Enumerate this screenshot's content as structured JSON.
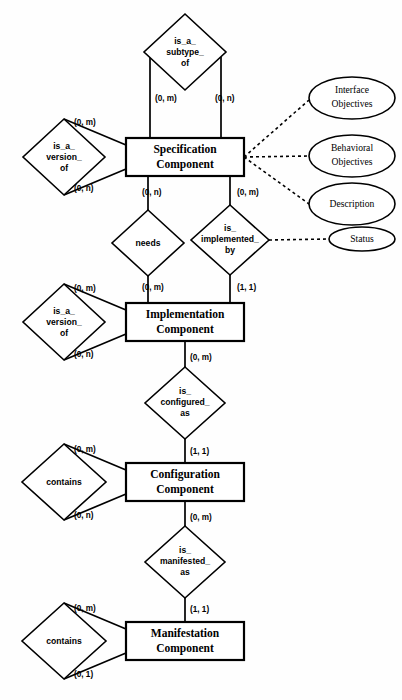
{
  "diagram": {
    "background_color": "#fefefe",
    "line_color": "#000000",
    "entities": [
      {
        "id": "specification-component",
        "label_line1": "Specification",
        "label_line2": "Component",
        "x": 126,
        "y": 138,
        "w": 118,
        "h": 38
      },
      {
        "id": "implementation-component",
        "label_line1": "Implementation",
        "label_line2": "Component",
        "x": 126,
        "y": 303,
        "w": 118,
        "h": 38
      },
      {
        "id": "configuration-component",
        "label_line1": "Configuration",
        "label_line2": "Component",
        "x": 126,
        "y": 463,
        "w": 118,
        "h": 38
      },
      {
        "id": "manifestation-component",
        "label_line1": "Manifestation",
        "label_line2": "Component",
        "x": 126,
        "y": 622,
        "w": 118,
        "h": 38
      }
    ],
    "relationships": [
      {
        "id": "is-a-subtype-of",
        "lines": [
          "is_a_",
          "subtype_",
          "of"
        ],
        "cx": 185,
        "cy": 52,
        "rx": 41,
        "ry": 38
      },
      {
        "id": "is-a-version-of-spec",
        "lines": [
          "is_a_",
          "version_",
          "of"
        ],
        "cx": 64,
        "cy": 157,
        "rx": 41,
        "ry": 38
      },
      {
        "id": "needs",
        "lines": [
          "needs"
        ],
        "cx": 148,
        "cy": 243,
        "rx": 36,
        "ry": 33
      },
      {
        "id": "is-implemented-by",
        "lines": [
          "is_",
          "implemented_",
          "by"
        ],
        "cx": 230,
        "cy": 240,
        "rx": 39,
        "ry": 35
      },
      {
        "id": "is-a-version-of-impl",
        "lines": [
          "is_a_",
          "version_",
          "of"
        ],
        "cx": 64,
        "cy": 322,
        "rx": 41,
        "ry": 38
      },
      {
        "id": "is-configured-as",
        "lines": [
          "is_",
          "configured_",
          "as"
        ],
        "cx": 185,
        "cy": 403,
        "rx": 40,
        "ry": 36
      },
      {
        "id": "contains-config",
        "lines": [
          "contains"
        ],
        "cx": 64,
        "cy": 482,
        "rx": 42,
        "ry": 38
      },
      {
        "id": "is-manifested-as",
        "lines": [
          "is_",
          "manifested_",
          "as"
        ],
        "cx": 185,
        "cy": 562,
        "rx": 40,
        "ry": 36
      },
      {
        "id": "contains-manifest",
        "lines": [
          "contains"
        ],
        "cx": 64,
        "cy": 641,
        "rx": 42,
        "ry": 38
      }
    ],
    "attributes": [
      {
        "id": "interface-objectives",
        "line1": "Interface",
        "line2": "Objectives",
        "cx": 352,
        "cy": 98,
        "rx": 43,
        "ry": 21
      },
      {
        "id": "behavioral-objectives",
        "line1": "Behavioral",
        "line2": "Objectives",
        "cx": 352,
        "cy": 156,
        "rx": 43,
        "ry": 21
      },
      {
        "id": "description",
        "line1": "Description",
        "line2": "",
        "cx": 352,
        "cy": 204,
        "rx": 43,
        "ry": 21
      },
      {
        "id": "status",
        "line1": "Status",
        "line2": "",
        "cx": 362,
        "cy": 239,
        "rx": 33,
        "ry": 12
      }
    ],
    "cardinalities": [
      {
        "id": "subtype-left",
        "text": "(0, m)",
        "x": 155,
        "y": 99
      },
      {
        "id": "subtype-right",
        "text": "(0, n)",
        "x": 215,
        "y": 99
      },
      {
        "id": "version-spec-top",
        "text": "(0, m)",
        "x": 74,
        "y": 123
      },
      {
        "id": "version-spec-bottom",
        "text": "(0, n)",
        "x": 74,
        "y": 189
      },
      {
        "id": "needs-top",
        "text": "(0, n)",
        "x": 142,
        "y": 193
      },
      {
        "id": "impl-by-top",
        "text": "(0, m)",
        "x": 237,
        "y": 193
      },
      {
        "id": "needs-bottom",
        "text": "(0, m)",
        "x": 142,
        "y": 288
      },
      {
        "id": "impl-by-bottom",
        "text": "(1, 1)",
        "x": 237,
        "y": 288
      },
      {
        "id": "version-impl-top",
        "text": "(0, m)",
        "x": 74,
        "y": 289
      },
      {
        "id": "version-impl-bottom",
        "text": "(0, n)",
        "x": 74,
        "y": 355
      },
      {
        "id": "configured-top",
        "text": "(0, m)",
        "x": 190,
        "y": 358
      },
      {
        "id": "configured-bottom",
        "text": "(1, 1)",
        "x": 190,
        "y": 452
      },
      {
        "id": "contains-config-top",
        "text": "(0, m)",
        "x": 74,
        "y": 450
      },
      {
        "id": "contains-config-bottom",
        "text": "(0, n)",
        "x": 74,
        "y": 516
      },
      {
        "id": "manifested-top",
        "text": "(0, m)",
        "x": 190,
        "y": 518
      },
      {
        "id": "manifested-bottom",
        "text": "(1, 1)",
        "x": 190,
        "y": 610
      },
      {
        "id": "contains-manifest-top",
        "text": "(0, m)",
        "x": 74,
        "y": 609
      },
      {
        "id": "contains-manifest-bottom",
        "text": "(0, 1)",
        "x": 74,
        "y": 675
      }
    ]
  }
}
